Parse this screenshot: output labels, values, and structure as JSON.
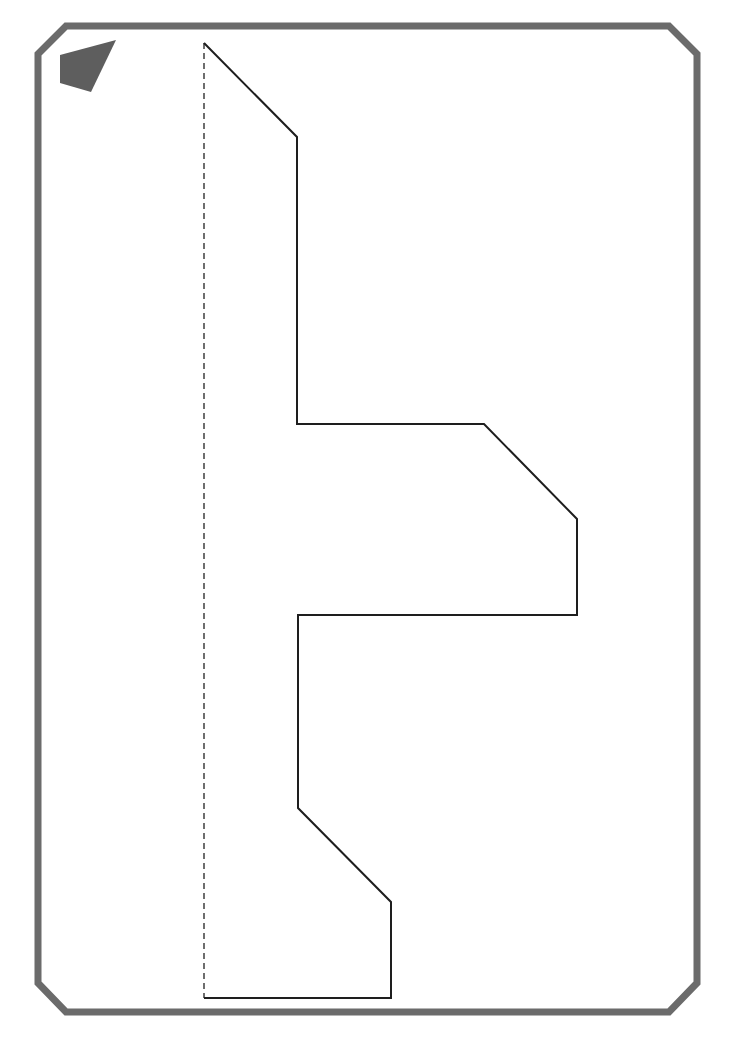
{
  "page": {
    "width": 739,
    "height": 1052,
    "background": "#ffffff"
  },
  "colors": {
    "frame": "#6b6b6b",
    "corner_marker": "#5e5e5e",
    "outline": "#1e1e1e",
    "fold_line": "#6e6e6e"
  },
  "frame": {
    "description": "octagonal-cornered card border",
    "stroke_width": 7,
    "points": "66,26 669,26 697,54 697,983 669,1012 66,1012 38,983 38,54"
  },
  "corner_marker": {
    "description": "filled quadrilateral orientation marker",
    "points": "60,55 116,40 91,92 60,83"
  },
  "fold_line": {
    "description": "dashed vertical fold / symmetry line",
    "x1": 204,
    "y1": 43,
    "x2": 204,
    "y2": 998,
    "dash": "6,4",
    "stroke_width": 2
  },
  "cutout_shape": {
    "description": "half-template outline of a symmetric shape (arrow-like cross)",
    "stroke_width": 2,
    "points": "204,43 297,137 297,424 484,424 577,519 577,615 298,615 298,808 391,902 391,998 204,998"
  }
}
